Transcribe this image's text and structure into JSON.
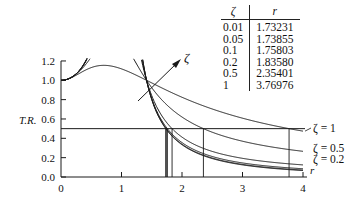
{
  "chart_data": {
    "type": "line",
    "title": "",
    "xlabel": "r",
    "ylabel": "T.R.",
    "xlim": [
      0,
      4
    ],
    "ylim": [
      0,
      1.2
    ],
    "x_ticks": [
      "0",
      "1",
      "2",
      "3",
      "4"
    ],
    "y_ticks": [
      "0.0",
      "0.2",
      "0.4",
      "0.6",
      "0.8",
      "1.0",
      "1.2"
    ],
    "grid": false,
    "formula": "T.R. = sqrt((1+(2ζr)^2)/((1-r^2)^2+(2ζr)^2))",
    "series": [
      {
        "name": "ζ = 0.01",
        "zeta": 0.01
      },
      {
        "name": "ζ = 0.05",
        "zeta": 0.05
      },
      {
        "name": "ζ = 0.1",
        "zeta": 0.1
      },
      {
        "name": "ζ = 0.2",
        "zeta": 0.2
      },
      {
        "name": "ζ = 0.5",
        "zeta": 0.5
      },
      {
        "name": "ζ = 1",
        "zeta": 1
      }
    ],
    "reference_line": {
      "y": 0.5
    },
    "vertical_markers": [
      1.73231,
      1.73855,
      1.75803,
      1.8358,
      2.35401,
      3.76976
    ],
    "annotations": [
      {
        "text": "ζ",
        "note": "arrow indicating increasing ζ near r≈√2"
      },
      {
        "text": "ζ = 1"
      },
      {
        "text": "ζ = 0.5"
      },
      {
        "text": "ζ = 0.2"
      }
    ],
    "table": {
      "headers": [
        "ζ",
        "r"
      ],
      "rows": [
        [
          "0.01",
          "1.73231"
        ],
        [
          "0.05",
          "1.73855"
        ],
        [
          "0.1",
          "1.75803"
        ],
        [
          "0.2",
          "1.83580"
        ],
        [
          "0.5",
          "2.35401"
        ],
        [
          "1",
          "3.76976"
        ]
      ]
    }
  },
  "labels": {
    "ylabel": "T.R.",
    "xlabel": "r",
    "arrow_label": "ζ",
    "curve_label_1": "ζ = 1",
    "curve_label_05": "ζ = 0.5",
    "curve_label_02": "ζ = 0.2"
  },
  "table": {
    "header_zeta": "ζ",
    "header_r": "r",
    "rows": [
      {
        "zeta": "0.01",
        "r": "1.73231"
      },
      {
        "zeta": "0.05",
        "r": "1.73855"
      },
      {
        "zeta": "0.1",
        "r": "1.75803"
      },
      {
        "zeta": "0.2",
        "r": "1.83580"
      },
      {
        "zeta": "0.5",
        "r": "2.35401"
      },
      {
        "zeta": "1",
        "r": "3.76976"
      }
    ]
  }
}
